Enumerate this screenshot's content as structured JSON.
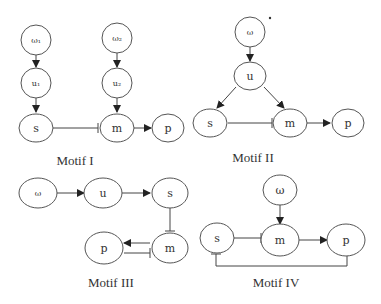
{
  "motifs": [
    {
      "label": "Motif I",
      "nodes": {
        "omega1": "ω₁",
        "omega2": "ω₂",
        "u1": "u₁",
        "u2": "u₂",
        "s": "s",
        "m": "m",
        "p": "p"
      },
      "edges": [
        {
          "from": "ω₁",
          "to": "u₁",
          "type": "activation"
        },
        {
          "from": "u₁",
          "to": "s",
          "type": "activation"
        },
        {
          "from": "ω₂",
          "to": "u₂",
          "type": "activation"
        },
        {
          "from": "u₂",
          "to": "m",
          "type": "activation"
        },
        {
          "from": "s",
          "to": "m",
          "type": "inhibition"
        },
        {
          "from": "m",
          "to": "p",
          "type": "activation"
        }
      ]
    },
    {
      "label": "Motif II",
      "nodes": {
        "omega": "ω",
        "u": "u",
        "s": "s",
        "m": "m",
        "p": "p"
      },
      "edges": [
        {
          "from": "ω",
          "to": "u",
          "type": "activation"
        },
        {
          "from": "u",
          "to": "s",
          "type": "activation"
        },
        {
          "from": "u",
          "to": "m",
          "type": "activation"
        },
        {
          "from": "s",
          "to": "m",
          "type": "inhibition"
        },
        {
          "from": "m",
          "to": "p",
          "type": "activation"
        }
      ]
    },
    {
      "label": "Motif III",
      "nodes": {
        "omega": "ω",
        "u": "u",
        "s": "s",
        "m": "m",
        "p": "p"
      },
      "edges": [
        {
          "from": "ω",
          "to": "u",
          "type": "activation"
        },
        {
          "from": "u",
          "to": "s",
          "type": "activation"
        },
        {
          "from": "s",
          "to": "m",
          "type": "inhibition"
        },
        {
          "from": "m",
          "to": "p",
          "type": "activation"
        },
        {
          "from": "p",
          "to": "m",
          "type": "inhibition"
        }
      ]
    },
    {
      "label": "Motif IV",
      "nodes": {
        "omega": "ω",
        "s": "s",
        "m": "m",
        "p": "p"
      },
      "edges": [
        {
          "from": "ω",
          "to": "m",
          "type": "activation"
        },
        {
          "from": "s",
          "to": "m",
          "type": "inhibition"
        },
        {
          "from": "m",
          "to": "p",
          "type": "activation"
        },
        {
          "from": "p",
          "to": "s",
          "type": "inhibition"
        }
      ]
    }
  ]
}
